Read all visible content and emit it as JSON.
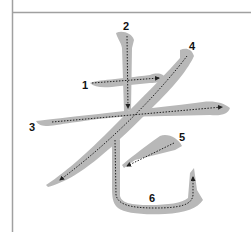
{
  "diagram": {
    "character": "老",
    "type": "stroke-order",
    "colors": {
      "background": "#ffffff",
      "grid_line": "#a0a0a0",
      "stroke_fill": "#b8b8b8",
      "guide_line": "#222222",
      "label": "#111111"
    },
    "strokes": [
      {
        "order": "1",
        "label": "1",
        "direction": "left-to-right",
        "kind": "horizontal"
      },
      {
        "order": "2",
        "label": "2",
        "direction": "top-to-bottom",
        "kind": "vertical"
      },
      {
        "order": "3",
        "label": "3",
        "direction": "left-to-right",
        "kind": "horizontal"
      },
      {
        "order": "4",
        "label": "4",
        "direction": "top-right-to-bottom-left",
        "kind": "left-falling"
      },
      {
        "order": "5",
        "label": "5",
        "direction": "top-right-to-bottom-left",
        "kind": "left-falling"
      },
      {
        "order": "6",
        "label": "6",
        "direction": "down-then-right-then-up",
        "kind": "vertical-bend-hook"
      }
    ]
  }
}
